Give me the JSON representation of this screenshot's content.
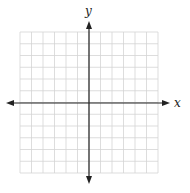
{
  "chart_data": {
    "type": "coordinate-grid",
    "title": "",
    "xlabel": "x",
    "ylabel": "y",
    "xlim": [
      -6,
      6
    ],
    "ylim": [
      -6,
      6
    ],
    "grid": true,
    "grid_columns": 12,
    "grid_rows": 12,
    "tick_labels": [],
    "series": [],
    "legend": null
  },
  "labels": {
    "x_axis": "x",
    "y_axis": "y"
  },
  "colors": {
    "grid": "#d4d4d4",
    "axis": "#222222",
    "background": "#ffffff"
  },
  "layout": {
    "grid_left": 20,
    "grid_top": 32,
    "cell_w": 11.5,
    "cell_h": 11.75
  }
}
